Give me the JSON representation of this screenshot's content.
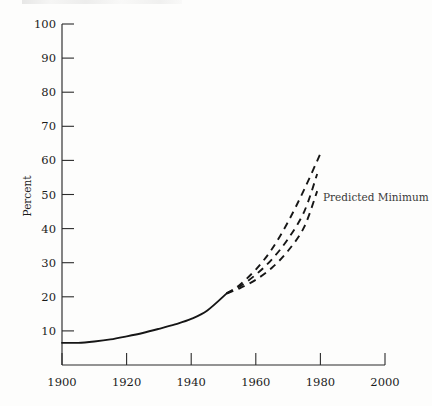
{
  "chart_data": {
    "type": "line",
    "title": "",
    "xlabel": "",
    "ylabel": "Percent",
    "xlim": [
      1900,
      2000
    ],
    "ylim": [
      0,
      100
    ],
    "grid": false,
    "legend_position": "inline-annotation",
    "x_ticks": [
      "1900",
      "1920",
      "1940",
      "1960",
      "1980",
      "2000"
    ],
    "x_tick_values": [
      1900,
      1920,
      1940,
      1960,
      1980,
      2000
    ],
    "y_ticks": [
      "10",
      "20",
      "30",
      "40",
      "50",
      "60",
      "70",
      "80",
      "90",
      "100"
    ],
    "y_tick_values": [
      10,
      20,
      30,
      40,
      50,
      60,
      70,
      80,
      90,
      100
    ],
    "annotations": [
      {
        "text": "Predicted Minimum",
        "x": 1985,
        "y": 51,
        "points_to_series": "Predicted Minimum"
      }
    ],
    "series": [
      {
        "name": "Observed",
        "style": "solid",
        "x": [
          1900,
          1905,
          1910,
          1915,
          1920,
          1925,
          1930,
          1935,
          1940,
          1945,
          1951
        ],
        "values": [
          6.5,
          6.5,
          6.9,
          7.5,
          8.4,
          9.4,
          10.6,
          11.9,
          13.5,
          16.0,
          21.0
        ]
      },
      {
        "name": "Predicted Maximum",
        "style": "dashed",
        "x": [
          1951,
          1955,
          1960,
          1965,
          1970,
          1975,
          1980
        ],
        "values": [
          21.0,
          23.5,
          28.0,
          34.0,
          42.0,
          51.5,
          62.0
        ]
      },
      {
        "name": "Predicted Middle",
        "style": "dashed",
        "x": [
          1951,
          1955,
          1960,
          1965,
          1970,
          1975,
          1979
        ],
        "values": [
          21.0,
          23.0,
          26.5,
          31.0,
          37.0,
          45.0,
          56.0
        ]
      },
      {
        "name": "Predicted Minimum",
        "style": "dashed",
        "x": [
          1951,
          1955,
          1960,
          1965,
          1970,
          1975,
          1979
        ],
        "values": [
          21.0,
          22.5,
          25.0,
          28.5,
          33.5,
          40.5,
          51.0
        ]
      }
    ]
  },
  "axis": {
    "y_title": "Percent"
  }
}
